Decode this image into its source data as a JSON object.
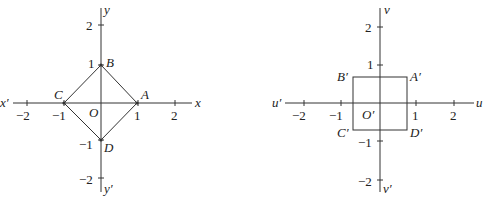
{
  "left": {
    "axes": {
      "x_pos": "x",
      "x_neg": "x′",
      "y_pos": "y",
      "y_neg": "y′"
    },
    "ticks": {
      "x": [
        "−2",
        "−1",
        "1",
        "2"
      ],
      "y": [
        "2",
        "1",
        "−1",
        "−2"
      ]
    },
    "origin": "O",
    "points": {
      "A": "A",
      "B": "B",
      "C": "C",
      "D": "D"
    },
    "shape": "diamond |x|+|y|=1"
  },
  "right": {
    "axes": {
      "x_pos": "u",
      "x_neg": "u′",
      "y_pos": "v",
      "y_neg": "v′"
    },
    "ticks": {
      "x": [
        "−2",
        "−1",
        "1",
        "2"
      ],
      "y": [
        "2",
        "1",
        "−1",
        "−2"
      ]
    },
    "origin": "O′",
    "points": {
      "A": "A′",
      "B": "B′",
      "C": "C′",
      "D": "D′"
    },
    "shape": "square side ≈ 1.44 (±1/√2)"
  },
  "colors": {
    "stroke": "#333333",
    "background": "#ffffff"
  }
}
